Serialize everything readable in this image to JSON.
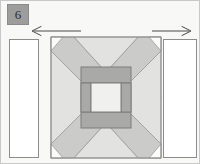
{
  "page": {
    "width": 200,
    "height": 164,
    "background": "#f8f8f6",
    "border_color": "#c9c9c9"
  },
  "step": {
    "number": "6",
    "badge_fill": "#9d9d9d",
    "badge_text_color": "#2b2b2b"
  },
  "arrows": [
    {
      "name": "left-arrow",
      "direction": "left",
      "label": "",
      "x1": 80,
      "x2": 31,
      "y": 30,
      "color": "#4a4a4a"
    },
    {
      "name": "right-arrow",
      "direction": "right",
      "label": "",
      "x1": 151,
      "x2": 190,
      "y": 30,
      "color": "#4a4a4a"
    }
  ],
  "palette": {
    "white": "#ffffff",
    "very_light_gray": "#efefee",
    "light_gray": "#e2e2e0",
    "medium_gray": "#c8c8c6",
    "dark_gray": "#a6a6a4",
    "outline": "#8c8c8c",
    "thin_outline": "#9a9a9a"
  },
  "pieces": {
    "left_strip": {
      "label": "left sashing strip",
      "x": 8,
      "y": 38,
      "width": 30,
      "height": 119,
      "fill": "#ffffff"
    },
    "right_strip": {
      "label": "right sashing strip",
      "x": 162,
      "y": 38,
      "width": 34,
      "height": 119,
      "fill": "#ffffff"
    },
    "block": {
      "label": "quilt block",
      "x": 50,
      "y": 36,
      "width": 110,
      "height": 121,
      "background_fill": "#e2e2e0"
    },
    "center_frame": {
      "label": "center square frame",
      "x": 80,
      "y": 66,
      "width": 50,
      "height": 61,
      "fill": "#a6a6a4"
    },
    "center_inner": {
      "label": "center inner patch",
      "x": 90,
      "y": 82,
      "width": 30,
      "height": 29,
      "fill": "#efefee"
    }
  }
}
